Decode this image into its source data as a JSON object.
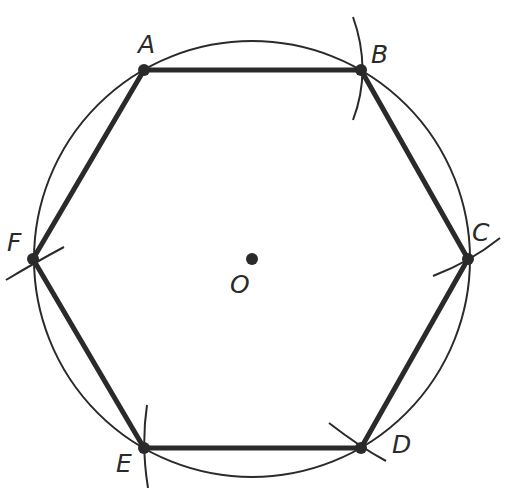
{
  "diagram": {
    "title": "",
    "type": "regular hexagon inscribed in circle (compass construction)",
    "circle": {
      "center": "O",
      "cx": 252,
      "cy": 259,
      "r": 218
    },
    "points": [
      {
        "id": "A",
        "label": "A",
        "x": 144,
        "y": 70
      },
      {
        "id": "B",
        "label": "B",
        "x": 361,
        "y": 70
      },
      {
        "id": "C",
        "label": "C",
        "x": 468,
        "y": 259
      },
      {
        "id": "D",
        "label": "D",
        "x": 361,
        "y": 448
      },
      {
        "id": "E",
        "label": "E",
        "x": 144,
        "y": 448
      },
      {
        "id": "F",
        "label": "F",
        "x": 33,
        "y": 259
      },
      {
        "id": "O",
        "label": "O",
        "x": 252,
        "y": 259
      }
    ],
    "edges": [
      [
        "A",
        "B"
      ],
      [
        "B",
        "C"
      ],
      [
        "C",
        "D"
      ],
      [
        "D",
        "E"
      ],
      [
        "E",
        "F"
      ],
      [
        "F",
        "A"
      ]
    ],
    "labels": {
      "A": "A",
      "B": "B",
      "C": "C",
      "D": "D",
      "E": "E",
      "F": "F",
      "O": "O"
    },
    "colors": {
      "stroke": "#2a2a2a",
      "background": "#ffffff"
    }
  }
}
